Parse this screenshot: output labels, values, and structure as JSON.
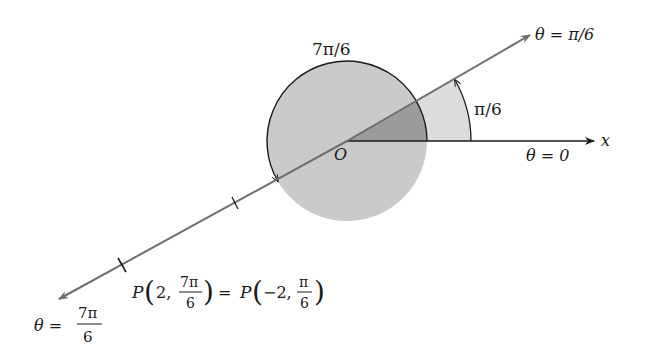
{
  "diagram": {
    "colors": {
      "circle_fill": "#cacaca",
      "wedge_dark": "#9c9c9c",
      "wedge_light": "#dcdcdc",
      "ray": "#6e6e6e",
      "ink": "#1a1a1a"
    },
    "origin_label": "O",
    "x_axis_label": "x",
    "labels": {
      "theta_pi6": "θ = π/6",
      "theta_zero": "θ = 0",
      "arc_7pi6": "7π/6",
      "arc_pi6": "π/6",
      "theta_7pi6_lhs": "θ = ",
      "theta_7pi6_num": "7π",
      "theta_7pi6_den": "6",
      "point_P1_prefix": "P",
      "point_P1_r": "2,",
      "point_P1_num": "7π",
      "point_P1_den": "6",
      "equals": "=",
      "point_P2_prefix": "P",
      "point_P2_r": "−2,",
      "point_P2_num": "π",
      "point_P2_den": "6"
    }
  }
}
